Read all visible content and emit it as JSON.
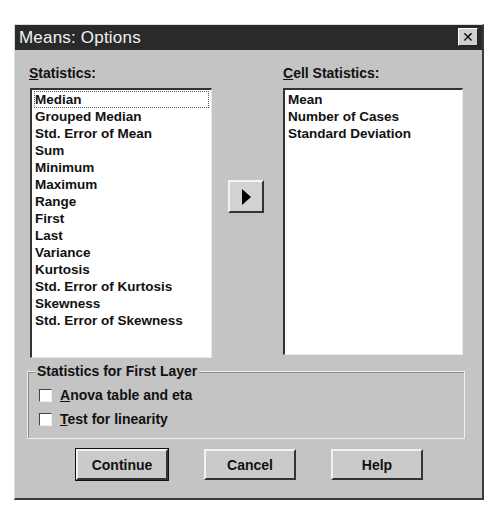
{
  "window": {
    "title": "Means: Options",
    "close_icon": "close-x-icon"
  },
  "statistics": {
    "label_prefix": "S",
    "label_rest": "tatistics:",
    "items": [
      "Median",
      "Grouped Median",
      "Std. Error of Mean",
      "Sum",
      "Minimum",
      "Maximum",
      "Range",
      "First",
      "Last",
      "Variance",
      "Kurtosis",
      "Std. Error of Kurtosis",
      "Skewness",
      "Std. Error of Skewness"
    ]
  },
  "move_button": {
    "icon": "right-arrow-icon"
  },
  "cell_statistics": {
    "label_prefix": "C",
    "label_rest": "ell Statistics:",
    "items": [
      "Mean",
      "Number of Cases",
      "Standard Deviation"
    ]
  },
  "first_layer": {
    "legend": "Statistics for First Layer",
    "options": [
      {
        "prefix": "A",
        "rest": "nova table and eta",
        "checked": false
      },
      {
        "prefix": "T",
        "rest": "est for linearity",
        "checked": false
      }
    ]
  },
  "buttons": {
    "continue": "Continue",
    "cancel": "Cancel",
    "help": "Help"
  }
}
